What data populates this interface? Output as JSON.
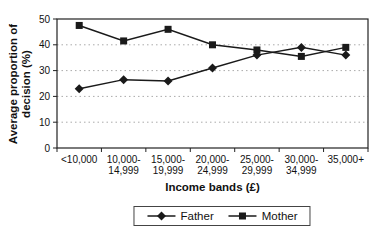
{
  "chart_data": {
    "type": "line",
    "categories": [
      "<10,000",
      "10,000-14,999",
      "15,000-19,999",
      "20,000-24,999",
      "25,000-29,999",
      "30,000-34,999",
      "35,000+"
    ],
    "tick_lines": [
      [
        "<10,000"
      ],
      [
        "10,000-",
        "14,999"
      ],
      [
        "15,000-",
        "19,999"
      ],
      [
        "20,000-",
        "24,999"
      ],
      [
        "25,000-",
        "29,999"
      ],
      [
        "30,000-",
        "34,999"
      ],
      [
        "35,000+"
      ]
    ],
    "series": [
      {
        "name": "Father",
        "marker": "diamond",
        "values": [
          23,
          26.5,
          26,
          31,
          36,
          39,
          36
        ]
      },
      {
        "name": "Mother",
        "marker": "square",
        "values": [
          47.5,
          41.5,
          46,
          40,
          38,
          35.5,
          39
        ]
      }
    ],
    "title": "",
    "xlabel": "Income bands (£)",
    "ylabel": "Average proportion of decision (%)",
    "ylim": [
      0,
      50
    ],
    "yticks": [
      0,
      10,
      20,
      30,
      40,
      50
    ],
    "grid": "horizontal-dotted",
    "legend_position": "bottom",
    "line_color": "#1a1a1a",
    "grid_color": "#aaaaaa",
    "background": "#ffffff"
  }
}
